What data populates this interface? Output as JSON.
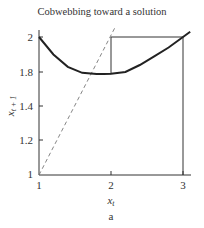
{
  "chart_data": {
    "type": "line",
    "title": "Cobwebbing toward a solution",
    "xlabel": "x_t",
    "ylabel": "x_{t+1}",
    "caption": "a",
    "x_ticks": [
      "1",
      "2",
      "3"
    ],
    "y_ticks": [
      "1",
      "1.2",
      "1.4",
      "1.8",
      "2"
    ],
    "xlim": [
      1,
      3.1
    ],
    "ylim": [
      1,
      2.05
    ],
    "grid": false,
    "legend": null,
    "series": [
      {
        "name": "map curve",
        "style": "solid-thick",
        "x": [
          1.0,
          1.2,
          1.4,
          1.6,
          1.8,
          1.9,
          2.0,
          2.2,
          2.4,
          2.6,
          2.8,
          3.0,
          3.1
        ],
        "y": [
          2.0,
          1.9,
          1.83,
          1.79,
          1.775,
          1.775,
          1.78,
          1.8,
          1.84,
          1.89,
          1.94,
          2.0,
          2.03
        ]
      },
      {
        "name": "diagonal x_{t+1} = x_t",
        "style": "dashed",
        "x": [
          1.0,
          2.05
        ],
        "y": [
          1.0,
          2.05
        ]
      },
      {
        "name": "cobweb path",
        "style": "solid-thin",
        "x": [
          3.0,
          3.0,
          2.0,
          2.0,
          1.78
        ],
        "y": [
          1.0,
          2.0,
          2.0,
          1.78,
          1.78
        ]
      }
    ]
  }
}
